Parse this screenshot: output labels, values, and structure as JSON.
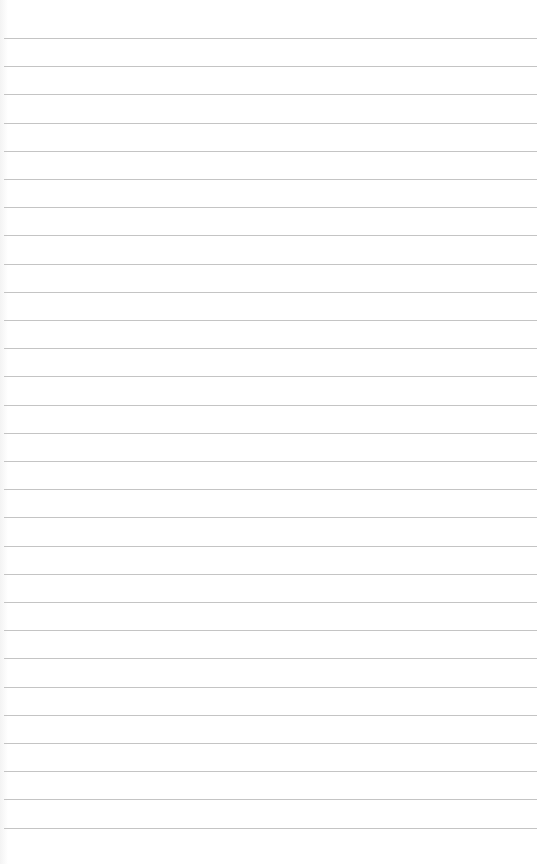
{
  "paper": {
    "type": "lined-paper",
    "background_color": "#ffffff",
    "line_color": "#c4c4c4",
    "line_count": 29,
    "first_line_y": 38,
    "line_spacing": 28.2
  }
}
